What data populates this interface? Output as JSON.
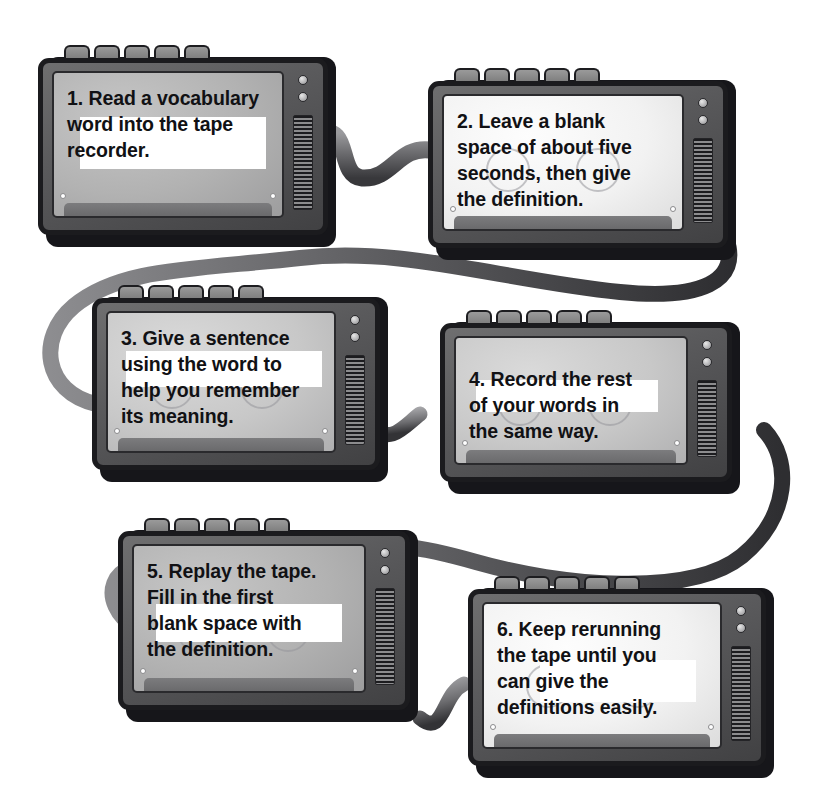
{
  "diagram": {
    "device_type": "tape-recorder",
    "colors": {
      "page_background": "#ffffff",
      "chassis_dark": "#1b1b1e",
      "chassis_body": "#5a5a5c",
      "ribbon": "#5f5f62",
      "screen_light": "#f2f2f2",
      "screen_dark": "#b2b2b2",
      "text": "#111114"
    }
  },
  "steps": [
    {
      "number": "1.",
      "text": "Read a vocabulary word into the tape recorder.",
      "lines": [
        "Read a vocabulary",
        "word into the tape",
        "recorder."
      ],
      "screen_tone": "tone-dark"
    },
    {
      "number": "2.",
      "text": "Leave a blank space of about five seconds, then give the definition.",
      "lines": [
        "Leave a blank",
        "space of about five",
        "seconds, then give",
        "the definition."
      ],
      "screen_tone": "tone-light"
    },
    {
      "number": "3.",
      "text": "Give a sentence using the word to help you remember its meaning.",
      "lines": [
        "Give a sentence",
        "using the word to",
        "help you remember",
        "its meaning."
      ],
      "screen_tone": "tone-mid"
    },
    {
      "number": "4.",
      "text": "Record the rest of your words in the same way.",
      "lines": [
        "Record the rest",
        "of your words in",
        "the same way."
      ],
      "screen_tone": "tone-mid"
    },
    {
      "number": "5.",
      "text": "Replay the tape. Fill in the first blank space with the definition.",
      "lines": [
        "Replay the tape.",
        "Fill in the first",
        "blank space with",
        "the definition."
      ],
      "screen_tone": "tone-dark"
    },
    {
      "number": "6.",
      "text": "Keep rerunning the tape until you can give the definitions easily.",
      "lines": [
        "Keep rerunning",
        "the tape until you",
        "can give the",
        "definitions easily."
      ],
      "screen_tone": "tone-light"
    }
  ],
  "icons": {
    "knob": "knob-icon",
    "speaker_grille": "speaker-grille-icon",
    "top_button": "top-button-icon",
    "screw": "screw-icon",
    "reel": "tape-reel-icon",
    "ribbon": "tape-ribbon-icon"
  }
}
